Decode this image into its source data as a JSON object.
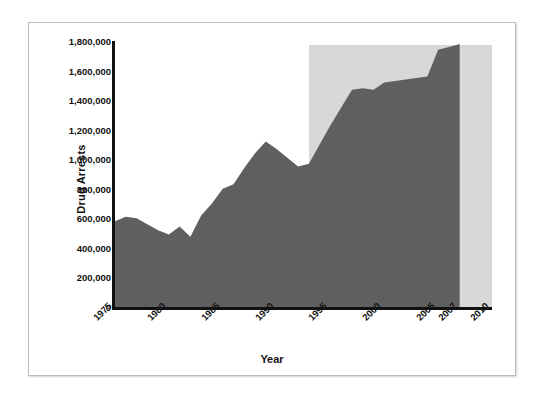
{
  "chart_data": {
    "type": "area",
    "title": "",
    "xlabel": "Year",
    "ylabel": "Drug Arrests",
    "xlim": [
      1975,
      2010
    ],
    "ylim": [
      0,
      1800000
    ],
    "grid": false,
    "legend": null,
    "series_name": "Drug Arrests",
    "series_color": "#5f5f5f",
    "shaded_region": {
      "label": "",
      "color": "#d8d8d8",
      "x_start": 1993,
      "x_end": 2010
    },
    "y_ticks": [
      0,
      200000,
      400000,
      600000,
      800000,
      1000000,
      1200000,
      1400000,
      1600000,
      1800000
    ],
    "y_tick_labels": [
      "0",
      "200,000",
      "400,000",
      "600,000",
      "800,000",
      "1,000,000",
      "1,200,000",
      "1,400,000",
      "1,600,000",
      "1,800,000"
    ],
    "x_ticks": [
      1975,
      1980,
      1985,
      1990,
      1995,
      2000,
      2005,
      2007,
      2010
    ],
    "x_tick_labels": [
      "1975",
      "1980",
      "1985",
      "1990",
      "1995",
      "2000",
      "2005",
      "2007",
      "2010"
    ],
    "x": [
      1975,
      1976,
      1977,
      1978,
      1979,
      1980,
      1981,
      1982,
      1983,
      1984,
      1985,
      1986,
      1987,
      1988,
      1989,
      1990,
      1991,
      1992,
      1993,
      1994,
      1995,
      1996,
      1997,
      1998,
      1999,
      2000,
      2001,
      2002,
      2003,
      2004,
      2005,
      2006,
      2007
    ],
    "values": [
      580000,
      610000,
      600000,
      560000,
      520000,
      490000,
      545000,
      475000,
      620000,
      700000,
      800000,
      830000,
      940000,
      1040000,
      1120000,
      1070000,
      1010000,
      950000,
      970000,
      1100000,
      1230000,
      1350000,
      1470000,
      1480000,
      1470000,
      1520000,
      1530000,
      1540000,
      1550000,
      1560000,
      1740000,
      1760000,
      1780000
    ]
  },
  "figure": {
    "border_color": "#bdbdbd",
    "background": "#ffffff",
    "axis_color": "#111111"
  }
}
